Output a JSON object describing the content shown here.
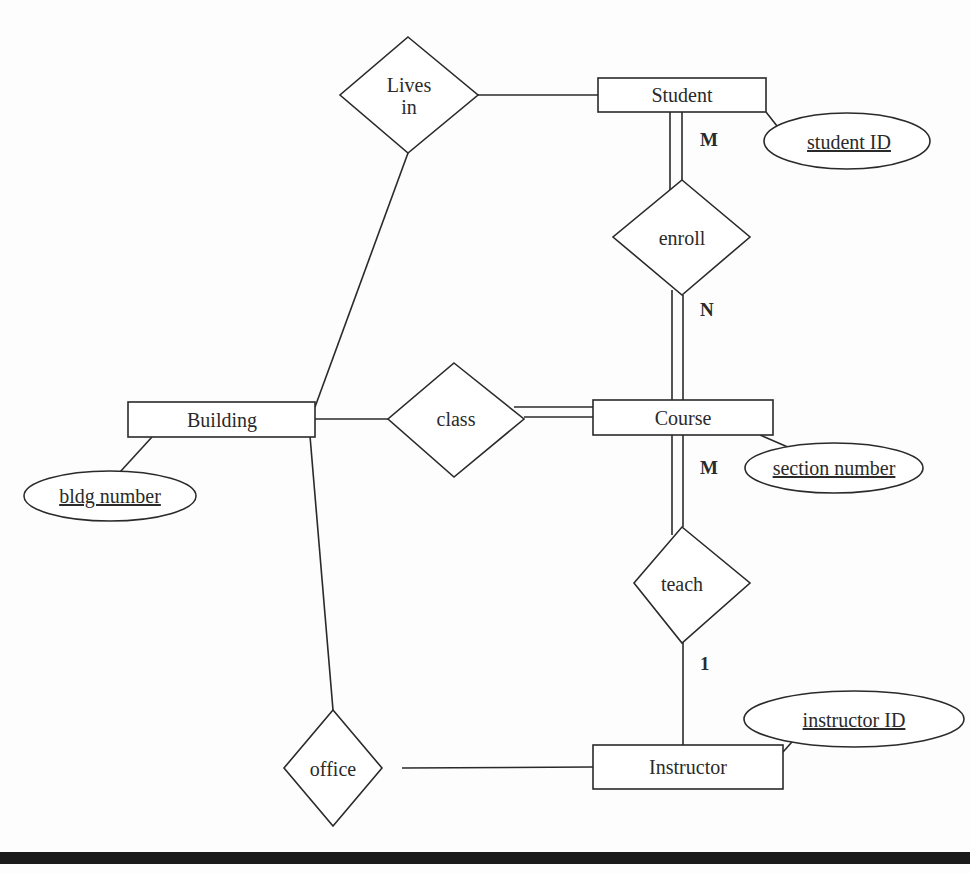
{
  "diagram": {
    "type": "entity-relationship",
    "entities": [
      {
        "id": "student",
        "label": "Student"
      },
      {
        "id": "course",
        "label": "Course"
      },
      {
        "id": "building",
        "label": "Building"
      },
      {
        "id": "instructor",
        "label": "Instructor"
      }
    ],
    "relationships": [
      {
        "id": "lives_in",
        "label_line1": "Lives",
        "label_line2": "in"
      },
      {
        "id": "enroll",
        "label": "enroll"
      },
      {
        "id": "class",
        "label": "class"
      },
      {
        "id": "teach",
        "label": "teach"
      },
      {
        "id": "office",
        "label": "office"
      }
    ],
    "attributes": [
      {
        "id": "student_id",
        "label": "student ID",
        "key": true,
        "entity": "Student"
      },
      {
        "id": "section_number",
        "label": "section number",
        "key": true,
        "entity": "Course"
      },
      {
        "id": "bldg_number",
        "label": "bldg number",
        "key": true,
        "entity": "Building"
      },
      {
        "id": "instructor_id",
        "label": "instructor ID",
        "key": true,
        "entity": "Instructor"
      }
    ],
    "cardinalities": {
      "student_enroll": "M",
      "enroll_course": "N",
      "course_teach": "M",
      "teach_instructor": "1"
    },
    "connections": [
      {
        "from": "Lives in",
        "to": "Student",
        "participation": "partial"
      },
      {
        "from": "Lives in",
        "to": "Building",
        "participation": "partial"
      },
      {
        "from": "Student",
        "to": "enroll",
        "participation": "total"
      },
      {
        "from": "enroll",
        "to": "Course",
        "participation": "total"
      },
      {
        "from": "Building",
        "to": "class",
        "participation": "partial"
      },
      {
        "from": "class",
        "to": "Course",
        "participation": "total"
      },
      {
        "from": "Course",
        "to": "teach",
        "participation": "total"
      },
      {
        "from": "teach",
        "to": "Instructor",
        "participation": "partial"
      },
      {
        "from": "Building",
        "to": "office",
        "participation": "partial"
      },
      {
        "from": "office",
        "to": "Instructor",
        "participation": "partial"
      }
    ]
  }
}
